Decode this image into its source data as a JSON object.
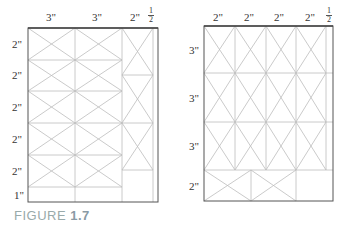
{
  "figure": {
    "caption_word": "FIGURE",
    "caption_number": "1.7"
  },
  "left_diagram": {
    "column_labels": [
      "3\"",
      "3\"",
      "2\""
    ],
    "column_fraction": {
      "numerator": "1",
      "denominator": "2",
      "unit": "\""
    },
    "row_labels": [
      "2\"",
      "2\"",
      "2\"",
      "2\"",
      "2\"",
      "1\""
    ]
  },
  "right_diagram": {
    "column_labels": [
      "2\"",
      "2\"",
      "2\"",
      "2\""
    ],
    "column_fraction": {
      "numerator": "1",
      "denominator": "2",
      "unit": "\""
    },
    "row_labels": [
      "3\"",
      "3\"",
      "3\"",
      "2\""
    ]
  },
  "colors": {
    "frame": "#555555",
    "grid": "#b8b8b8",
    "label": "#333333",
    "caption": "#9aaab0"
  }
}
